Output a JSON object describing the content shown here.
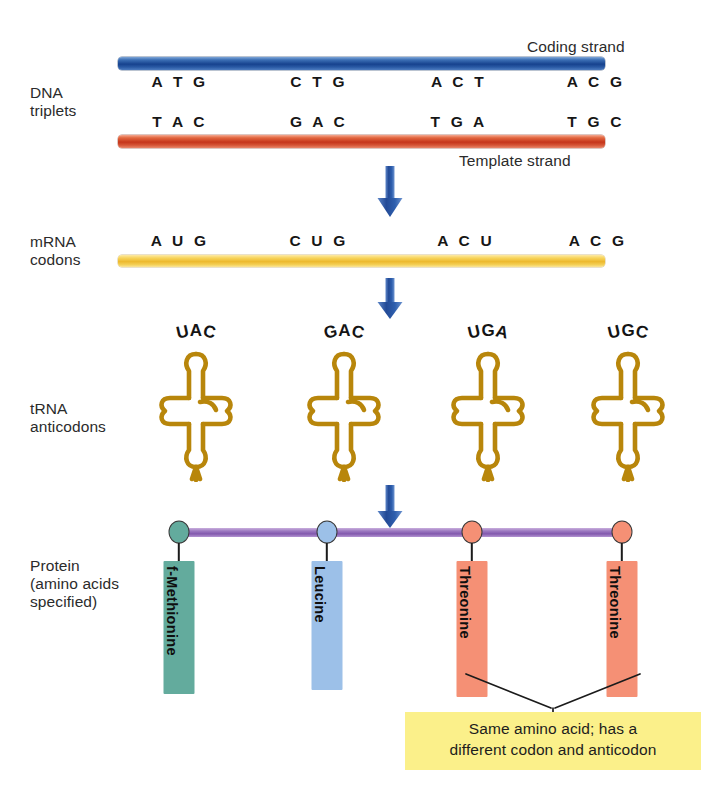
{
  "diagram": {
    "rows": {
      "dna": {
        "label": "DNA\ntriplets"
      },
      "mrna": {
        "label": "mRNA\ncodons"
      },
      "trna": {
        "label": "tRNA\nanticodons"
      },
      "protein": {
        "label": "Protein\n(amino acids\nspecified)"
      }
    },
    "strand_labels": {
      "coding": "Coding strand",
      "template": "Template strand"
    },
    "dna_coding_triplets": [
      "A T G",
      "C T G",
      "A C T",
      "A C G"
    ],
    "dna_template_triplets": [
      "T A C",
      "G A C",
      "T G A",
      "T G C"
    ],
    "mrna_codons": [
      "A U G",
      "C U G",
      "A C U",
      "A C G"
    ],
    "trna_anticodons": [
      "UAC",
      "GAC",
      "UGA",
      "UGC"
    ],
    "amino_acids": [
      {
        "name": "f-Methionine",
        "bar_color": "#63ab9d",
        "node_color": "#63ab9d"
      },
      {
        "name": "Leucine",
        "bar_color": "#9cc0e8",
        "node_color": "#9cc0e8"
      },
      {
        "name": "Threonine",
        "bar_color": "#f59075",
        "node_color": "#f59075"
      },
      {
        "name": "Threonine",
        "bar_color": "#f59075",
        "node_color": "#f59075"
      }
    ],
    "callout": {
      "line1": "Same amino acid; has a",
      "line2": "different codon and anticodon"
    },
    "colors": {
      "coding_strand": "#16428e",
      "template_strand": "#c5351b",
      "mrna_strand": "#edb92e",
      "trna": "#b8860b",
      "backbone": "#8258ad",
      "arrow": "#2b5aa8",
      "callout_bg": "#fbf08a",
      "text": "#2b2b2b"
    }
  }
}
